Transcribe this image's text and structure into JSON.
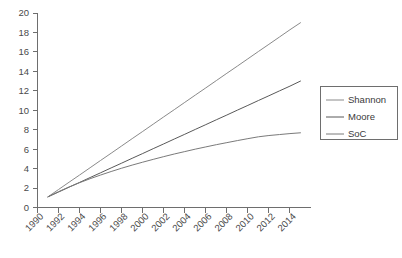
{
  "chart_data": {
    "type": "line",
    "title": "",
    "xlabel": "",
    "ylabel": "",
    "xlim": [
      1990,
      2016
    ],
    "ylim": [
      0,
      20
    ],
    "grid": false,
    "legend_position": "right",
    "xticks": [
      "1990",
      "1992",
      "1994",
      "1996",
      "1998",
      "2000",
      "2002",
      "2004",
      "2006",
      "2008",
      "2010",
      "2012",
      "2014"
    ],
    "yticks": [
      "0",
      "2",
      "4",
      "6",
      "8",
      "10",
      "12",
      "14",
      "16",
      "18",
      "20"
    ],
    "x": [
      1991,
      1992,
      1993,
      1994,
      1995,
      1996,
      1997,
      1998,
      1999,
      2000,
      2001,
      2002,
      2003,
      2004,
      2005,
      2006,
      2007,
      2008,
      2009,
      2010,
      2011,
      2012,
      2013,
      2014,
      2015
    ],
    "series": [
      {
        "name": "Shannon",
        "color": "#8a8a8a",
        "values": [
          1.1,
          1.85,
          2.6,
          3.34,
          4.09,
          4.84,
          5.58,
          6.33,
          7.08,
          7.82,
          8.57,
          9.32,
          10.06,
          10.81,
          11.56,
          12.3,
          13.05,
          13.8,
          14.54,
          15.29,
          16.04,
          16.78,
          17.53,
          18.28,
          19.0
        ]
      },
      {
        "name": "Moore",
        "color": "#595959",
        "values": [
          1.1,
          1.59,
          2.09,
          2.58,
          3.08,
          3.57,
          4.07,
          4.56,
          5.06,
          5.55,
          6.05,
          6.54,
          7.04,
          7.53,
          8.03,
          8.52,
          9.02,
          9.51,
          10.01,
          10.5,
          11.0,
          11.49,
          11.99,
          12.48,
          13.0
        ]
      },
      {
        "name": "SoC",
        "color": "#7a7a7a",
        "values": [
          1.1,
          1.63,
          2.11,
          2.55,
          2.96,
          3.34,
          3.7,
          4.04,
          4.36,
          4.66,
          4.95,
          5.23,
          5.5,
          5.75,
          6.0,
          6.23,
          6.46,
          6.67,
          6.88,
          7.08,
          7.27,
          7.4,
          7.5,
          7.6,
          7.68
        ]
      }
    ]
  },
  "legend": {
    "items": [
      {
        "label": "Shannon"
      },
      {
        "label": "Moore"
      },
      {
        "label": "SoC"
      }
    ]
  }
}
